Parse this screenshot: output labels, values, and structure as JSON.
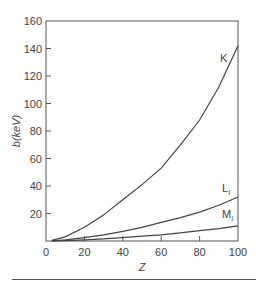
{
  "chart_data": {
    "type": "line",
    "title": "",
    "xlabel": "Z",
    "ylabel": "b(keV)",
    "xlim": [
      0,
      100
    ],
    "ylim": [
      0,
      160
    ],
    "xticks": [
      0,
      20,
      40,
      60,
      80,
      100
    ],
    "yticks": [
      20,
      40,
      60,
      80,
      100,
      120,
      140,
      160
    ],
    "xtick_labels": [
      "0",
      "20",
      "40",
      "60",
      "80",
      "100"
    ],
    "ytick_labels": [
      "20",
      "40",
      "60",
      "80",
      "100",
      "120",
      "140",
      "160"
    ],
    "grid": false,
    "legend": "inline labels at curve ends",
    "x": [
      3,
      10,
      20,
      30,
      40,
      50,
      60,
      70,
      80,
      90,
      100
    ],
    "series": [
      {
        "name": "K",
        "label": "K",
        "values": [
          0.5,
          3,
          10,
          19,
          30,
          41,
          53,
          70,
          88,
          112,
          142
        ]
      },
      {
        "name": "L1",
        "label": "L",
        "subscript": "I",
        "values": [
          0.1,
          0.8,
          2.5,
          4.5,
          7,
          10,
          13.5,
          17,
          21,
          26,
          32
        ]
      },
      {
        "name": "M1",
        "label": "M",
        "subscript": "I",
        "values": [
          0.05,
          0.3,
          0.8,
          1.5,
          2.5,
          3.5,
          4.5,
          6,
          7.5,
          9,
          11
        ]
      }
    ]
  }
}
